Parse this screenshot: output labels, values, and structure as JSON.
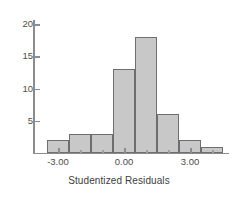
{
  "chart_data": {
    "type": "bar",
    "title": "",
    "subtitle": "",
    "xlabel": "Studentized Residuals",
    "ylabel": "",
    "grid": false,
    "legend": null,
    "legend_position": "none",
    "xlim": [
      -3.9,
      4.9
    ],
    "ylim": [
      0,
      21
    ],
    "bin_width": 1.0,
    "bin_edges": [
      -3.5,
      -2.5,
      -1.5,
      -0.5,
      0.5,
      1.5,
      2.5,
      3.5,
      4.5
    ],
    "bin_centers": [
      -3.0,
      -2.0,
      -1.0,
      0.0,
      1.0,
      2.0,
      3.0,
      4.0
    ],
    "categories": [
      "-3.5 to -2.5",
      "-2.5 to -1.5",
      "-1.5 to -0.5",
      "-0.5 to 0.5",
      "0.5 to 1.5",
      "1.5 to 2.5",
      "2.5 to 3.5",
      "3.5 to 4.5"
    ],
    "values": [
      2,
      3,
      3,
      13,
      18,
      6,
      2,
      1
    ],
    "x_ticks": [
      {
        "value": -3.0,
        "label": "-3.00"
      },
      {
        "value": 0.0,
        "label": "0.00"
      },
      {
        "value": 3.0,
        "label": "3.00"
      }
    ],
    "x_minor_ticks": [
      -2.0,
      -1.0,
      1.0,
      2.0,
      4.0
    ],
    "y_ticks": [
      {
        "value": 5,
        "label": "5"
      },
      {
        "value": 10,
        "label": "10"
      },
      {
        "value": 15,
        "label": "15"
      },
      {
        "value": 20,
        "label": "20"
      }
    ],
    "colors": {
      "bar_fill": "#c8c8c8",
      "bar_border": "#6e6e6e",
      "axis": "#8c8c8c",
      "text": "#4d4d4d",
      "background": "#ffffff"
    }
  }
}
